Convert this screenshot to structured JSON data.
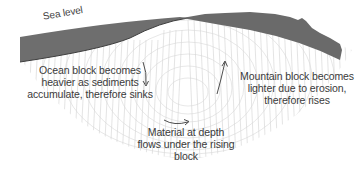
{
  "diagram": {
    "type": "isostasy-cross-section",
    "labels": {
      "sea_level": "Sea level",
      "ocean_block": "Ocean block becomes heavier as sediments accumulate, therefore sinks",
      "mountain_block": "Mountain block becomes lighter due to erosion, therefore rises",
      "material_at_depth": "Material at depth flows under the rising block"
    },
    "arrows": [
      {
        "name": "sinking-arrow",
        "direction": "down"
      },
      {
        "name": "rising-arrow",
        "direction": "up"
      },
      {
        "name": "flow-arrow",
        "direction": "right"
      }
    ],
    "colors": {
      "ocean_water": "#6e6e6e",
      "mountain": "#6a6a6a",
      "hatching": "#cfcfcf",
      "text": "#3a3a3a",
      "background": "#ffffff"
    }
  }
}
